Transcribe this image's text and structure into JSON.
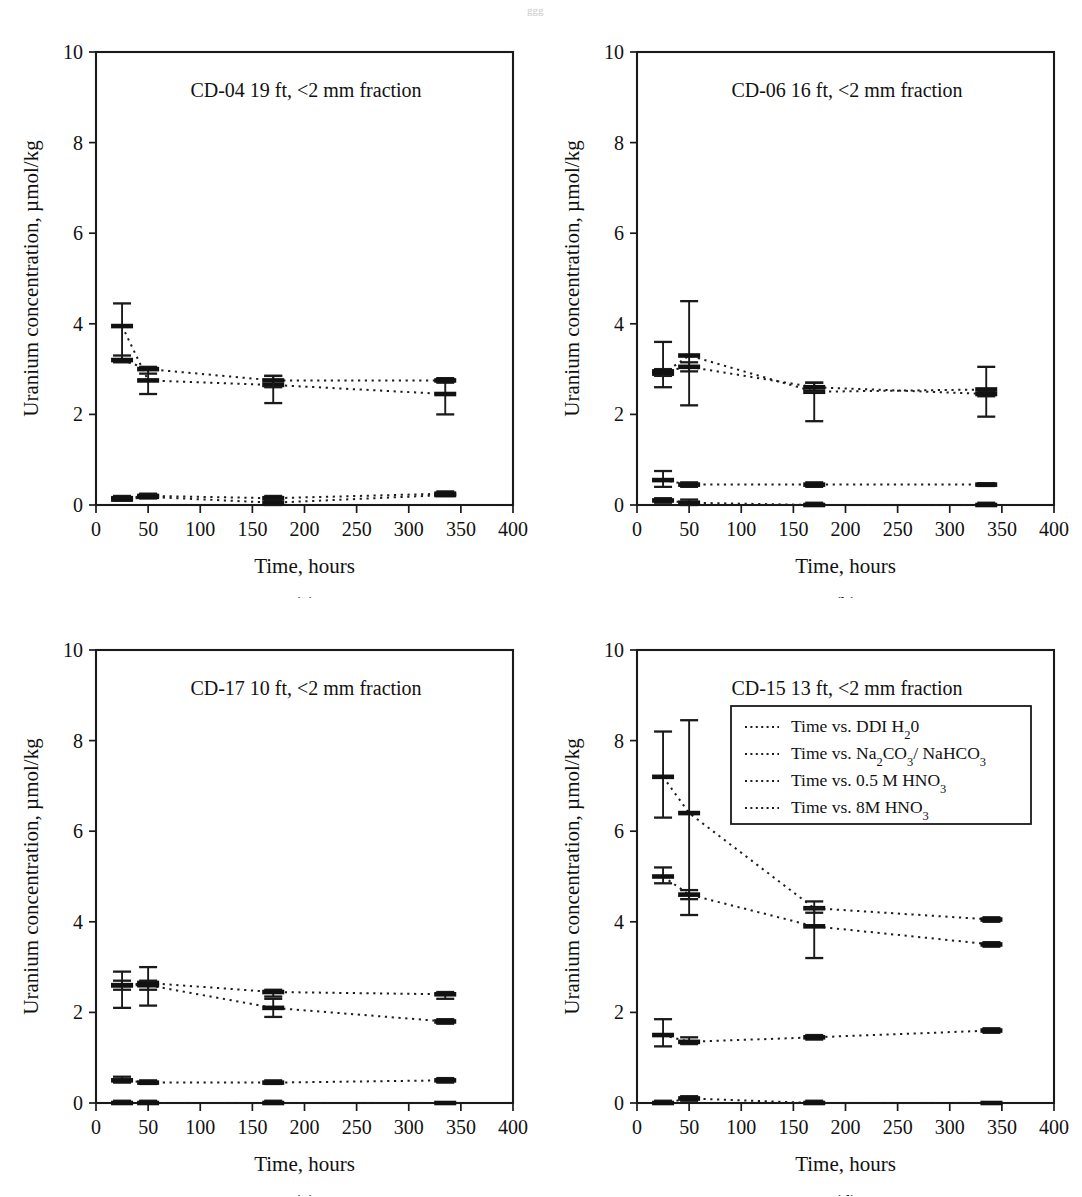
{
  "figure": {
    "axis": {
      "xlabel": "Time, hours",
      "ylabel": "Uranium concentration, µmol/kg",
      "xticks": [
        0,
        50,
        100,
        150,
        200,
        250,
        300,
        350,
        400
      ],
      "yticks": [
        0,
        2,
        4,
        6,
        8,
        10
      ],
      "xlim": [
        0,
        400
      ],
      "ylim": [
        0,
        10
      ]
    },
    "legend": {
      "position": "panel-d-top-right",
      "entries": [
        {
          "label": "Time vs. DDI H",
          "sub": "2",
          "tail": "0",
          "series": "ddi_h2o"
        },
        {
          "label": "Time vs. Na",
          "sub": "2",
          "mid": "CO",
          "sub2": "3",
          "tail": "/ NaHCO",
          "sub3": "3",
          "series": "na2co3_nahco3"
        },
        {
          "label": "Time vs. 0.5 M HNO",
          "sub": "3",
          "series": "hno3_0p5m"
        },
        {
          "label": "Time vs. 8M HNO",
          "sub": "3",
          "series": "hno3_8m"
        }
      ]
    },
    "panels": [
      {
        "key": "a",
        "caption": "(a)",
        "title": "CD-04 19 ft, <2 mm fraction"
      },
      {
        "key": "b",
        "caption": "(b)",
        "title": "CD-06 16 ft, <2 mm fraction"
      },
      {
        "key": "c",
        "caption": "(c)",
        "title": "CD-17 10 ft, <2 mm fraction"
      },
      {
        "key": "d",
        "caption": "(d)",
        "title": "CD-15 13 ft, <2 mm fraction"
      }
    ]
  },
  "chart_data": [
    {
      "panel": "a",
      "type": "line",
      "title": "CD-04 19 ft, <2 mm fraction",
      "xlabel": "Time, hours",
      "ylabel": "Uranium concentration, µmol/kg",
      "xlim": [
        0,
        400
      ],
      "ylim": [
        0,
        10
      ],
      "grid": false,
      "x": [
        25,
        50,
        170,
        335
      ],
      "series": [
        {
          "name": "Time vs. DDI H20",
          "values": [
            3.95,
            2.75,
            2.65,
            2.45
          ],
          "err_low": [
            3.2,
            2.45,
            2.25,
            2.0
          ],
          "err_high": [
            4.45,
            3.0,
            2.85,
            2.75
          ]
        },
        {
          "name": "Time vs. Na2CO3/ NaHCO3",
          "values": [
            3.2,
            3.0,
            2.75,
            2.75
          ],
          "err_low": [
            3.15,
            2.9,
            2.6,
            2.7
          ],
          "err_high": [
            3.3,
            3.05,
            2.85,
            2.8
          ]
        },
        {
          "name": "Time vs. 0.5 M HNO3",
          "values": [
            0.15,
            0.2,
            0.15,
            0.25
          ],
          "err_low": [
            0.12,
            0.15,
            0.1,
            0.2
          ],
          "err_high": [
            0.2,
            0.25,
            0.2,
            0.3
          ]
        },
        {
          "name": "Time vs. 8M HNO3",
          "values": [
            0.12,
            0.18,
            0.05,
            0.22
          ],
          "err_low": [
            0.1,
            0.15,
            0.0,
            0.2
          ],
          "err_high": [
            0.15,
            0.22,
            0.1,
            0.25
          ]
        }
      ]
    },
    {
      "panel": "b",
      "type": "line",
      "title": "CD-06 16 ft, <2 mm fraction",
      "xlabel": "Time, hours",
      "ylabel": "Uranium concentration, µmol/kg",
      "xlim": [
        0,
        400
      ],
      "ylim": [
        0,
        10
      ],
      "grid": false,
      "x": [
        25,
        50,
        170,
        335
      ],
      "series": [
        {
          "name": "Time vs. DDI H20",
          "values": [
            2.9,
            3.3,
            2.5,
            2.55
          ],
          "err_low": [
            2.6,
            2.2,
            1.85,
            1.95
          ],
          "err_high": [
            3.6,
            4.5,
            2.7,
            3.05
          ]
        },
        {
          "name": "Time vs. Na2CO3/ NaHCO3",
          "values": [
            2.95,
            3.05,
            2.6,
            2.45
          ],
          "err_low": [
            2.85,
            2.95,
            2.5,
            2.4
          ],
          "err_high": [
            3.0,
            3.15,
            2.7,
            2.5
          ]
        },
        {
          "name": "Time vs. 0.5 M HNO3",
          "values": [
            0.55,
            0.45,
            0.45,
            0.45
          ],
          "err_low": [
            0.4,
            0.4,
            0.4,
            0.42
          ],
          "err_high": [
            0.75,
            0.5,
            0.5,
            0.48
          ]
        },
        {
          "name": "Time vs. 8M HNO3",
          "values": [
            0.1,
            0.05,
            0.0,
            0.0
          ],
          "err_low": [
            0.05,
            0.0,
            0.0,
            0.0
          ],
          "err_high": [
            0.15,
            0.12,
            0.05,
            0.05
          ]
        }
      ]
    },
    {
      "panel": "c",
      "type": "line",
      "title": "CD-17 10 ft, <2 mm fraction",
      "xlabel": "Time, hours",
      "ylabel": "Uranium concentration, µmol/kg",
      "xlim": [
        0,
        400
      ],
      "ylim": [
        0,
        10
      ],
      "grid": false,
      "x": [
        25,
        50,
        170,
        335
      ],
      "series": [
        {
          "name": "Time vs. DDI H20",
          "values": [
            2.6,
            2.65,
            2.45,
            2.4
          ],
          "err_low": [
            2.1,
            2.15,
            2.35,
            2.3
          ],
          "err_high": [
            2.9,
            3.0,
            2.5,
            2.45
          ]
        },
        {
          "name": "Time vs. Na2CO3/ NaHCO3",
          "values": [
            2.6,
            2.6,
            2.1,
            1.8
          ],
          "err_low": [
            2.5,
            2.5,
            1.9,
            1.75
          ],
          "err_high": [
            2.7,
            2.7,
            2.3,
            1.85
          ]
        },
        {
          "name": "Time vs. 0.5 M HNO3",
          "values": [
            0.5,
            0.45,
            0.45,
            0.5
          ],
          "err_low": [
            0.45,
            0.42,
            0.42,
            0.45
          ],
          "err_high": [
            0.58,
            0.5,
            0.5,
            0.55
          ]
        },
        {
          "name": "Time vs. 8M HNO3",
          "values": [
            0.0,
            0.0,
            0.0,
            0.0
          ],
          "err_low": [
            0.0,
            0.0,
            0.0,
            0.0
          ],
          "err_high": [
            0.05,
            0.05,
            0.05,
            0.02
          ]
        }
      ]
    },
    {
      "panel": "d",
      "type": "line",
      "title": "CD-15 13 ft, <2 mm fraction",
      "xlabel": "Time, hours",
      "ylabel": "Uranium concentration, µmol/kg",
      "xlim": [
        0,
        400
      ],
      "ylim": [
        0,
        10
      ],
      "grid": false,
      "x": [
        25,
        50,
        170,
        340
      ],
      "series": [
        {
          "name": "Time vs. DDI H20",
          "values": [
            7.2,
            6.4,
            4.3,
            4.05
          ],
          "err_low": [
            6.3,
            4.15,
            4.2,
            4.0
          ],
          "err_high": [
            8.2,
            8.45,
            4.45,
            4.1
          ]
        },
        {
          "name": "Time vs. Na2CO3/ NaHCO3",
          "values": [
            5.0,
            4.6,
            3.9,
            3.5
          ],
          "err_low": [
            4.85,
            4.5,
            3.2,
            3.45
          ],
          "err_high": [
            5.2,
            4.7,
            4.3,
            3.55
          ]
        },
        {
          "name": "Time vs. 0.5 M HNO3",
          "values": [
            1.5,
            1.35,
            1.45,
            1.6
          ],
          "err_low": [
            1.25,
            1.3,
            1.4,
            1.55
          ],
          "err_high": [
            1.85,
            1.45,
            1.5,
            1.65
          ]
        },
        {
          "name": "Time vs. 8M HNO3",
          "values": [
            0.0,
            0.1,
            0.0,
            0.0
          ],
          "err_low": [
            0.0,
            0.05,
            0.0,
            0.0
          ],
          "err_high": [
            0.05,
            0.15,
            0.05,
            0.02
          ]
        }
      ]
    }
  ]
}
